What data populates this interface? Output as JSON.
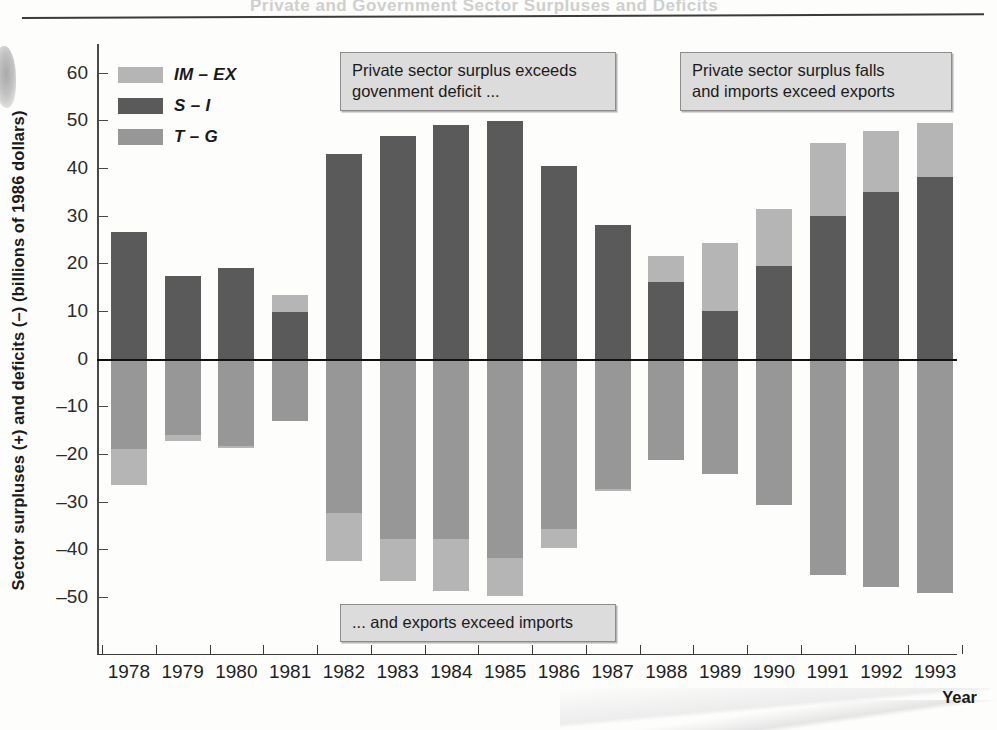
{
  "ghost_header_text": "Private and Government Sector Surpluses and Deficits",
  "axes": {
    "ylabel": "Sector surpluses (+) and deficits (–) (billions of 1986 dollars)",
    "xlabel": "Year",
    "yticks": [
      "60",
      "50",
      "40",
      "30",
      "20",
      "10",
      "0",
      "–10",
      "–20",
      "–30",
      "–40",
      "–50"
    ]
  },
  "legend": {
    "items": [
      {
        "label": "IM – EX",
        "color": "#b5b5b5",
        "key": "imex"
      },
      {
        "label": "S – I",
        "color": "#5a5a5a",
        "key": "si"
      },
      {
        "label": "T – G",
        "color": "#979797",
        "key": "tg"
      }
    ]
  },
  "annotations": [
    {
      "id": "callout-1",
      "text": "Private sector surplus exceeds\ngovenment deficit ..."
    },
    {
      "id": "callout-2",
      "text": "Private sector surplus falls\nand imports exceed exports"
    },
    {
      "id": "callout-3",
      "text": "... and exports exceed imports"
    }
  ],
  "chart_data": {
    "type": "bar",
    "subtype": "stacked-diverging",
    "title": "",
    "xlabel": "Year",
    "ylabel": "Sector surpluses (+) and deficits (–) (billions of 1986 dollars)",
    "ylim": [
      -62,
      66
    ],
    "ytick_values": [
      60,
      50,
      40,
      30,
      20,
      10,
      0,
      -10,
      -20,
      -30,
      -40,
      -50
    ],
    "grid": false,
    "legend_position": "upper-left-inside",
    "categories": [
      "1978",
      "1979",
      "1980",
      "1981",
      "1982",
      "1983",
      "1984",
      "1985",
      "1986",
      "1987",
      "1988",
      "1989",
      "1990",
      "1991",
      "1992",
      "1993"
    ],
    "series": [
      {
        "name": "IM – EX",
        "color": "#b5b5b5",
        "values": [
          -7.5,
          -1.3,
          -0.5,
          3.6,
          -10.0,
          -8.8,
          -11.0,
          -8.0,
          -4.0,
          -0.5,
          5.5,
          14.3,
          11.8,
          15.3,
          12.8,
          11.5
        ]
      },
      {
        "name": "S – I",
        "color": "#5a5a5a",
        "values": [
          26.5,
          17.3,
          19.0,
          9.7,
          43.0,
          46.8,
          49.0,
          49.8,
          40.3,
          28.0,
          16.0,
          10.0,
          19.5,
          30.0,
          35.0,
          38.0
        ]
      },
      {
        "name": "T – G",
        "color": "#979797",
        "values": [
          -19.0,
          -16.0,
          -18.3,
          -13.2,
          -32.5,
          -37.8,
          -37.8,
          -41.8,
          -35.8,
          -27.3,
          -21.3,
          -24.3,
          -30.8,
          -45.5,
          -48.0,
          -49.3
        ]
      }
    ],
    "bars": [
      {
        "year": "1978",
        "positive": [
          {
            "key": "si",
            "from": 0,
            "to": 26.5
          }
        ],
        "negative": [
          {
            "key": "tg",
            "from": 0,
            "to": -19.0
          },
          {
            "key": "imex",
            "from": -19.0,
            "to": -26.5
          }
        ]
      },
      {
        "year": "1979",
        "positive": [
          {
            "key": "si",
            "from": 0,
            "to": 17.3
          }
        ],
        "negative": [
          {
            "key": "tg",
            "from": 0,
            "to": -16.0
          },
          {
            "key": "imex",
            "from": -16.0,
            "to": -17.3
          }
        ]
      },
      {
        "year": "1980",
        "positive": [
          {
            "key": "si",
            "from": 0,
            "to": 19.0
          }
        ],
        "negative": [
          {
            "key": "tg",
            "from": 0,
            "to": -18.3
          },
          {
            "key": "imex",
            "from": -18.3,
            "to": -18.8
          }
        ]
      },
      {
        "year": "1981",
        "positive": [
          {
            "key": "si",
            "from": 0,
            "to": 9.7
          },
          {
            "key": "imex",
            "from": 9.7,
            "to": 13.3
          }
        ],
        "negative": [
          {
            "key": "tg",
            "from": 0,
            "to": -13.2
          }
        ]
      },
      {
        "year": "1982",
        "positive": [
          {
            "key": "si",
            "from": 0,
            "to": 43.0
          }
        ],
        "negative": [
          {
            "key": "tg",
            "from": 0,
            "to": -32.5
          },
          {
            "key": "imex",
            "from": -32.5,
            "to": -42.5
          }
        ]
      },
      {
        "year": "1983",
        "positive": [
          {
            "key": "si",
            "from": 0,
            "to": 46.8
          }
        ],
        "negative": [
          {
            "key": "tg",
            "from": 0,
            "to": -37.8
          },
          {
            "key": "imex",
            "from": -37.8,
            "to": -46.6
          }
        ]
      },
      {
        "year": "1984",
        "positive": [
          {
            "key": "si",
            "from": 0,
            "to": 49.0
          }
        ],
        "negative": [
          {
            "key": "tg",
            "from": 0,
            "to": -37.8
          },
          {
            "key": "imex",
            "from": -37.8,
            "to": -48.8
          }
        ]
      },
      {
        "year": "1985",
        "positive": [
          {
            "key": "si",
            "from": 0,
            "to": 49.8
          }
        ],
        "negative": [
          {
            "key": "tg",
            "from": 0,
            "to": -41.8
          },
          {
            "key": "imex",
            "from": -41.8,
            "to": -49.8
          }
        ]
      },
      {
        "year": "1986",
        "positive": [
          {
            "key": "si",
            "from": 0,
            "to": 40.3
          }
        ],
        "negative": [
          {
            "key": "tg",
            "from": 0,
            "to": -35.8
          },
          {
            "key": "imex",
            "from": -35.8,
            "to": -39.8
          }
        ]
      },
      {
        "year": "1987",
        "positive": [
          {
            "key": "si",
            "from": 0,
            "to": 28.0
          }
        ],
        "negative": [
          {
            "key": "tg",
            "from": 0,
            "to": -27.3
          },
          {
            "key": "imex",
            "from": -27.3,
            "to": -27.8
          }
        ]
      },
      {
        "year": "1988",
        "positive": [
          {
            "key": "si",
            "from": 0,
            "to": 16.0
          },
          {
            "key": "imex",
            "from": 16.0,
            "to": 21.5
          }
        ],
        "negative": [
          {
            "key": "tg",
            "from": 0,
            "to": -21.3
          }
        ]
      },
      {
        "year": "1989",
        "positive": [
          {
            "key": "si",
            "from": 0,
            "to": 10.0
          },
          {
            "key": "imex",
            "from": 10.0,
            "to": 24.3
          }
        ],
        "negative": [
          {
            "key": "tg",
            "from": 0,
            "to": -24.3
          }
        ]
      },
      {
        "year": "1990",
        "positive": [
          {
            "key": "si",
            "from": 0,
            "to": 19.5
          },
          {
            "key": "imex",
            "from": 19.5,
            "to": 31.3
          }
        ],
        "negative": [
          {
            "key": "tg",
            "from": 0,
            "to": -30.8
          }
        ]
      },
      {
        "year": "1991",
        "positive": [
          {
            "key": "si",
            "from": 0,
            "to": 30.0
          },
          {
            "key": "imex",
            "from": 30.0,
            "to": 45.3
          }
        ],
        "negative": [
          {
            "key": "tg",
            "from": 0,
            "to": -45.5
          }
        ]
      },
      {
        "year": "1992",
        "positive": [
          {
            "key": "si",
            "from": 0,
            "to": 35.0
          },
          {
            "key": "imex",
            "from": 35.0,
            "to": 47.8
          }
        ],
        "negative": [
          {
            "key": "tg",
            "from": 0,
            "to": -48.0
          }
        ]
      },
      {
        "year": "1993",
        "positive": [
          {
            "key": "si",
            "from": 0,
            "to": 38.0
          },
          {
            "key": "imex",
            "from": 38.0,
            "to": 49.5
          }
        ],
        "negative": [
          {
            "key": "tg",
            "from": 0,
            "to": -49.3
          }
        ]
      }
    ]
  }
}
